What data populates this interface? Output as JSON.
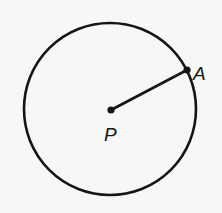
{
  "diagram": {
    "type": "circle-with-radius",
    "circle": {
      "cx": 110,
      "cy": 109,
      "r": 86,
      "stroke": "#151515"
    },
    "points": [
      {
        "id": "center",
        "label": "P",
        "x": 111,
        "y": 110,
        "label_x": 104,
        "label_y": 141
      },
      {
        "id": "on-circle",
        "label": "A",
        "x": 187,
        "y": 70,
        "label_x": 193,
        "label_y": 80
      }
    ],
    "segments": [
      {
        "from": "P",
        "to": "A"
      }
    ]
  }
}
